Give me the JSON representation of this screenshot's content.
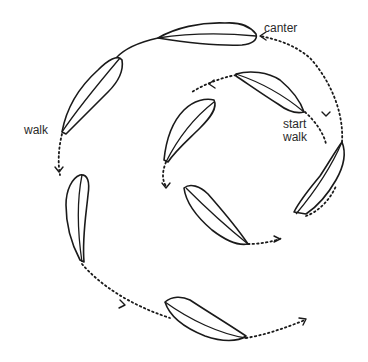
{
  "diagram": {
    "type": "spiral-gait-path",
    "labels": {
      "canter": "canter",
      "start_walk_line1": "start",
      "start_walk_line2": "walk",
      "walk": "walk"
    },
    "colors": {
      "ink": "#1a1a1a",
      "background": "#ffffff"
    },
    "segments": [
      {
        "from": "start walk",
        "style": "dotted",
        "direction": "counter-clockwise inner loop"
      },
      {
        "from": "inner loop",
        "to": "canter",
        "style": "dotted"
      },
      {
        "from": "canter",
        "to": "walk",
        "style": "solid"
      },
      {
        "from": "walk",
        "to": "end",
        "style": "dotted",
        "direction": "outer loop"
      }
    ]
  }
}
